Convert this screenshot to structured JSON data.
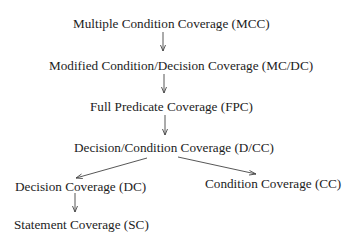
{
  "diagram": {
    "type": "hierarchy",
    "title": "",
    "nodes": [
      {
        "id": "mcc",
        "label": "Multiple Condition Coverage (MCC)"
      },
      {
        "id": "mcdc",
        "label": "Modified Condition/Decision Coverage (MC/DC)"
      },
      {
        "id": "fpc",
        "label": "Full Predicate Coverage (FPC)"
      },
      {
        "id": "dcc",
        "label": "Decision/Condition Coverage (D/CC)"
      },
      {
        "id": "dc",
        "label": "Decision Coverage (DC)"
      },
      {
        "id": "cc",
        "label": "Condition Coverage (CC)"
      },
      {
        "id": "sc",
        "label": "Statement Coverage (SC)"
      }
    ],
    "edges": [
      {
        "from": "mcc",
        "to": "mcdc"
      },
      {
        "from": "mcdc",
        "to": "fpc"
      },
      {
        "from": "fpc",
        "to": "dcc"
      },
      {
        "from": "dcc",
        "to": "dc"
      },
      {
        "from": "dcc",
        "to": "cc"
      },
      {
        "from": "dc",
        "to": "sc"
      }
    ],
    "colors": {
      "text": "#1c1c1c",
      "arrow": "#444444",
      "background": "#ffffff"
    }
  }
}
